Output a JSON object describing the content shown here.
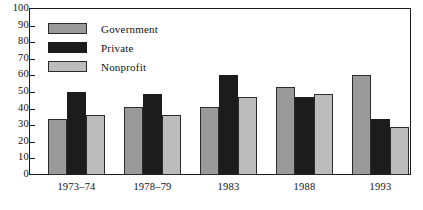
{
  "chart_data": {
    "type": "bar",
    "title": "",
    "xlabel": "",
    "ylabel": "",
    "ylim": [
      0,
      100
    ],
    "yticks": [
      0,
      10,
      20,
      30,
      40,
      50,
      60,
      70,
      80,
      90,
      100
    ],
    "ytick_labels": [
      "0",
      "10",
      "20",
      "30",
      "40",
      "50",
      "60",
      "70",
      "80",
      "90",
      "100"
    ],
    "grid": false,
    "legend_position": "upper-left",
    "categories": [
      "1973–74",
      "1978–79",
      "1983",
      "1988",
      "1993"
    ],
    "series": [
      {
        "name": "Government",
        "color": "#9a9a9a",
        "values": [
          34,
          41,
          41,
          53,
          60
        ]
      },
      {
        "name": "Private",
        "color": "#1c1c1c",
        "values": [
          50,
          49,
          60,
          47,
          34
        ]
      },
      {
        "name": "Nonprofit",
        "color": "#bcbcbc",
        "values": [
          36,
          36,
          47,
          49,
          29
        ]
      }
    ]
  },
  "legend": {
    "items": [
      {
        "label": "Government",
        "key": "government"
      },
      {
        "label": "Private",
        "key": "private"
      },
      {
        "label": "Nonprofit",
        "key": "nonprofit"
      }
    ]
  }
}
